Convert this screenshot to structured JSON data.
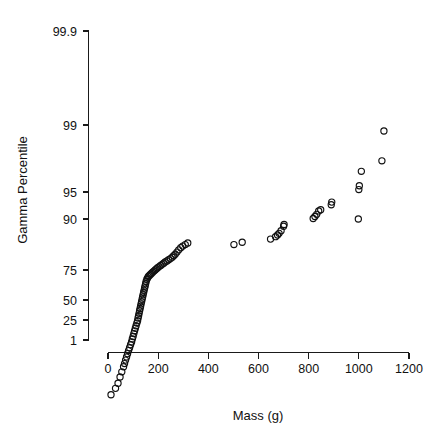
{
  "chart_data": {
    "type": "scatter",
    "title": "",
    "subtitle": "",
    "xlabel": "Mass (g)",
    "ylabel": "Gamma Percentile",
    "grid": false,
    "legend": null,
    "x_scale": "linear",
    "y_scale": "probability",
    "xlim": [
      0,
      1200
    ],
    "ylim": [
      1,
      99.9
    ],
    "x_ticks": [
      0,
      200,
      400,
      600,
      800,
      1000,
      1200
    ],
    "x_tick_labels": [
      "0",
      "200",
      "400",
      "600",
      "800",
      "1000",
      "1200"
    ],
    "y_ticks": [
      1,
      25,
      50,
      75,
      90,
      95,
      99,
      99.9
    ],
    "y_tick_labels": [
      "1",
      "25",
      "50",
      "75",
      "90",
      "95",
      "99",
      "99.9"
    ],
    "marker": "open-circle",
    "marker_size": 3.1,
    "marker_color": "#111111",
    "series": [
      {
        "name": "Gamma probability plot",
        "points": [
          [
            12,
            1.2
          ],
          [
            30,
            1.6
          ],
          [
            40,
            2.0
          ],
          [
            48,
            2.6
          ],
          [
            55,
            3.2
          ],
          [
            62,
            3.9
          ],
          [
            66,
            4.4
          ],
          [
            70,
            5.0
          ],
          [
            74,
            5.6
          ],
          [
            78,
            6.3
          ],
          [
            82,
            7.0
          ],
          [
            86,
            7.7
          ],
          [
            90,
            8.5
          ],
          [
            94,
            9.3
          ],
          [
            97,
            10.2
          ],
          [
            100,
            11.0
          ],
          [
            103,
            12.0
          ],
          [
            106,
            13.0
          ],
          [
            109,
            14.0
          ],
          [
            112,
            15.0
          ],
          [
            115,
            16.1
          ],
          [
            118,
            17.2
          ],
          [
            120,
            18.4
          ],
          [
            122,
            19.5
          ],
          [
            124,
            20.7
          ],
          [
            126,
            22.0
          ],
          [
            128,
            23.2
          ],
          [
            130,
            24.5
          ],
          [
            132,
            25.8
          ],
          [
            134,
            27.1
          ],
          [
            136,
            28.5
          ],
          [
            138,
            29.9
          ],
          [
            140,
            31.3
          ],
          [
            142,
            32.7
          ],
          [
            144,
            34.1
          ],
          [
            146,
            35.6
          ],
          [
            148,
            37.0
          ],
          [
            150,
            38.5
          ],
          [
            152,
            40.0
          ],
          [
            155,
            41.5
          ],
          [
            158,
            42.5
          ],
          [
            161,
            43.5
          ],
          [
            165,
            44.2
          ],
          [
            169,
            44.9
          ],
          [
            173,
            45.6
          ],
          [
            178,
            46.4
          ],
          [
            183,
            47.2
          ],
          [
            188,
            48.0
          ],
          [
            193,
            48.8
          ],
          [
            198,
            49.6
          ],
          [
            204,
            50.4
          ],
          [
            210,
            51.2
          ],
          [
            216,
            52.0
          ],
          [
            222,
            52.8
          ],
          [
            228,
            53.6
          ],
          [
            235,
            54.4
          ],
          [
            242,
            55.2
          ],
          [
            249,
            56.0
          ],
          [
            256,
            57.0
          ],
          [
            262,
            58.0
          ],
          [
            268,
            59.0
          ],
          [
            275,
            60.5
          ],
          [
            282,
            62.0
          ],
          [
            290,
            63.5
          ],
          [
            298,
            64.5
          ],
          [
            308,
            65.5
          ],
          [
            318,
            66.5
          ],
          [
            502,
            65.5
          ],
          [
            535,
            67.0
          ],
          [
            648,
            69.0
          ],
          [
            668,
            70.5
          ],
          [
            676,
            71.5
          ],
          [
            682,
            72.5
          ],
          [
            690,
            74.0
          ],
          [
            700,
            76.5
          ],
          [
            702,
            77.5
          ],
          [
            818,
            80.5
          ],
          [
            825,
            81.5
          ],
          [
            832,
            82.5
          ],
          [
            840,
            84.0
          ],
          [
            848,
            84.5
          ],
          [
            890,
            86.5
          ],
          [
            892,
            87.5
          ],
          [
            998,
            90.0
          ],
          [
            1000,
            91.5
          ],
          [
            1002,
            92.5
          ],
          [
            1010,
            95.5
          ],
          [
            1092,
            97.0
          ],
          [
            1100,
            99.2
          ]
        ]
      }
    ]
  },
  "axes": {
    "x_title": "Mass (g)",
    "y_title": "Gamma Percentile"
  },
  "colors": {
    "background": "#ffffff",
    "axis": "#1a1a1a",
    "marker": "#111111"
  }
}
